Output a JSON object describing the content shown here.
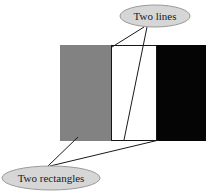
{
  "figure": {
    "title": "",
    "background_color": "#ffffff",
    "shapes": {
      "gray_rectangle": {
        "name": "gray-rectangle",
        "fill": "#828282",
        "stroke": "none",
        "x": 60,
        "y": 45,
        "width": 51,
        "height": 96
      },
      "white_rectangle": {
        "name": "white-rectangle",
        "fill": "#ffffff",
        "stroke": "#151515",
        "stroke_width": 1,
        "x": 111,
        "y": 45,
        "width": 46,
        "height": 96
      },
      "black_rectangle": {
        "name": "black-rectangle",
        "fill": "#050505",
        "stroke": "none",
        "x": 157,
        "y": 45,
        "width": 49,
        "height": 96
      }
    },
    "callouts": [
      {
        "id": "two-lines",
        "label": "Two lines",
        "ellipse": {
          "cx": 155,
          "cy": 16,
          "rx": 35,
          "ry": 11,
          "fill": "#d6d6d6",
          "stroke": "#9a9a9a",
          "stroke_width": 1
        },
        "leader_lines": [
          {
            "x1": 144,
            "y1": 27,
            "x2": 112,
            "y2": 47
          },
          {
            "x1": 147,
            "y1": 27,
            "x2": 124,
            "y2": 140
          }
        ],
        "leader_color": "#1a1a1a",
        "leader_width": 1
      },
      {
        "id": "two-rectangles",
        "label": "Two rectangles",
        "ellipse": {
          "cx": 51,
          "cy": 178,
          "rx": 49,
          "ry": 12,
          "fill": "#d6d6d6",
          "stroke": "#9a9a9a",
          "stroke_width": 1
        },
        "leader_lines": [
          {
            "x1": 48,
            "y1": 166,
            "x2": 78,
            "y2": 137
          },
          {
            "x1": 50,
            "y1": 166,
            "x2": 159,
            "y2": 140
          }
        ],
        "leader_color": "#1a1a1a",
        "leader_width": 1
      }
    ]
  }
}
